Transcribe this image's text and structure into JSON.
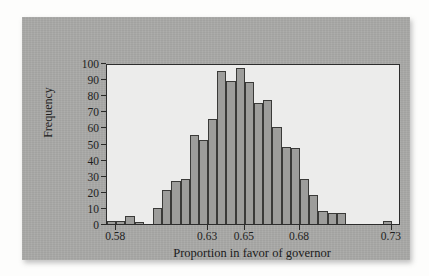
{
  "figure": {
    "background_color": "#fdfdfc",
    "panel_color": "#a8a8a6",
    "plot_background_color": "#ececeb",
    "bar_fill_color": "#9d9d9b",
    "bar_border_color": "#3a3a38",
    "axis_color": "#2c2c2c"
  },
  "chart_data": {
    "type": "bar",
    "title": "",
    "subtitle": "",
    "xlabel": "Proportion in favor of governor",
    "ylabel": "Frequency",
    "xlim": [
      0.575,
      0.735
    ],
    "ylim": [
      0,
      100
    ],
    "bin_width": 0.005,
    "grid": false,
    "legend": null,
    "x_tick_labels": [
      "0.58",
      "0.63",
      "0.65",
      "0.68",
      "0.73"
    ],
    "x_tick_values": [
      0.58,
      0.63,
      0.65,
      0.68,
      0.73
    ],
    "y_tick_labels": [
      "0",
      "10",
      "20",
      "30",
      "40",
      "50",
      "60",
      "70",
      "80",
      "90",
      "100"
    ],
    "y_tick_values": [
      0,
      10,
      20,
      30,
      40,
      50,
      60,
      70,
      80,
      90,
      100
    ],
    "bins": [
      {
        "left": 0.575,
        "right": 0.58,
        "value": 2
      },
      {
        "left": 0.58,
        "right": 0.585,
        "value": 2
      },
      {
        "left": 0.585,
        "right": 0.59,
        "value": 5
      },
      {
        "left": 0.59,
        "right": 0.595,
        "value": 1
      },
      {
        "left": 0.595,
        "right": 0.6,
        "value": 0
      },
      {
        "left": 0.6,
        "right": 0.605,
        "value": 10
      },
      {
        "left": 0.605,
        "right": 0.61,
        "value": 21
      },
      {
        "left": 0.61,
        "right": 0.615,
        "value": 27
      },
      {
        "left": 0.615,
        "right": 0.62,
        "value": 28
      },
      {
        "left": 0.62,
        "right": 0.625,
        "value": 55
      },
      {
        "left": 0.625,
        "right": 0.63,
        "value": 52
      },
      {
        "left": 0.63,
        "right": 0.635,
        "value": 65
      },
      {
        "left": 0.635,
        "right": 0.64,
        "value": 95
      },
      {
        "left": 0.64,
        "right": 0.645,
        "value": 89
      },
      {
        "left": 0.645,
        "right": 0.65,
        "value": 97
      },
      {
        "left": 0.65,
        "right": 0.655,
        "value": 88
      },
      {
        "left": 0.655,
        "right": 0.66,
        "value": 75
      },
      {
        "left": 0.66,
        "right": 0.665,
        "value": 77
      },
      {
        "left": 0.665,
        "right": 0.67,
        "value": 60
      },
      {
        "left": 0.67,
        "right": 0.675,
        "value": 48
      },
      {
        "left": 0.675,
        "right": 0.68,
        "value": 47
      },
      {
        "left": 0.68,
        "right": 0.685,
        "value": 28
      },
      {
        "left": 0.685,
        "right": 0.69,
        "value": 18
      },
      {
        "left": 0.69,
        "right": 0.695,
        "value": 8
      },
      {
        "left": 0.695,
        "right": 0.7,
        "value": 7
      },
      {
        "left": 0.7,
        "right": 0.705,
        "value": 7
      },
      {
        "left": 0.705,
        "right": 0.71,
        "value": 0
      },
      {
        "left": 0.71,
        "right": 0.715,
        "value": 0
      },
      {
        "left": 0.715,
        "right": 0.72,
        "value": 0
      },
      {
        "left": 0.72,
        "right": 0.725,
        "value": 0
      },
      {
        "left": 0.725,
        "right": 0.73,
        "value": 2
      },
      {
        "left": 0.73,
        "right": 0.735,
        "value": 0
      }
    ]
  }
}
